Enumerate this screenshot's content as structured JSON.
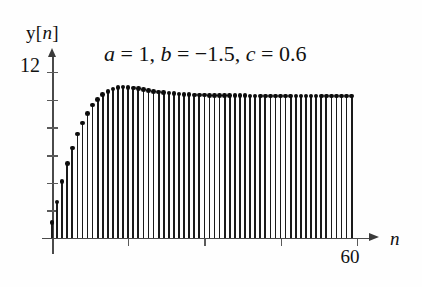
{
  "figure": {
    "title": "a = 1, b = −1.5, c = 0.6",
    "title_parts": {
      "a": "a",
      "eq1": " = 1, ",
      "b": "b",
      "eq2": " = −1.5, ",
      "c": "c",
      "eq3": " = 0.6"
    },
    "y_axis_label_base": "y[",
    "y_axis_label_var": "n",
    "y_axis_label_close": "]",
    "y_top_tick_label": "12",
    "x_tick_label": "60",
    "x_axis_label": "n",
    "line_color": "#1a1a1a",
    "axis_color": "#4a4a4a",
    "background": "#ffffff"
  },
  "chart_data": {
    "type": "line",
    "plot_style": "stem",
    "title": "a = 1, b = −1.5, c = 0.6",
    "xlabel": "n",
    "ylabel": "y[n]",
    "xlim": [
      0,
      63
    ],
    "ylim": [
      0,
      13
    ],
    "xticks": [
      0,
      15,
      30,
      45,
      60
    ],
    "xtick_labels": [
      "",
      "",
      "",
      "",
      "60"
    ],
    "yticks": [
      0,
      2,
      4,
      6,
      8,
      10,
      12
    ],
    "ytick_labels": [
      "",
      "",
      "",
      "",
      "",
      "",
      "12"
    ],
    "grid": false,
    "legend": null,
    "annotations": [
      {
        "text": "a = 1, b = −1.5, c = 0.6",
        "x": 18,
        "y": 12.4
      }
    ],
    "parameters": {
      "a": 1,
      "b": -1.5,
      "c": 0.6
    },
    "x": [
      0,
      1,
      2,
      3,
      4,
      5,
      6,
      7,
      8,
      9,
      10,
      11,
      12,
      13,
      14,
      15,
      16,
      17,
      18,
      19,
      20,
      21,
      22,
      23,
      24,
      25,
      26,
      27,
      28,
      29,
      30,
      31,
      32,
      33,
      34,
      35,
      36,
      37,
      38,
      39,
      40,
      41,
      42,
      43,
      44,
      45,
      46,
      47,
      48,
      49,
      50,
      51,
      52,
      53,
      54,
      55,
      56,
      57,
      58,
      59
    ],
    "values": [
      1.1,
      2.6,
      4.1,
      5.4,
      6.5,
      7.5,
      8.3,
      9.0,
      9.6,
      10.0,
      10.35,
      10.6,
      10.75,
      10.85,
      10.9,
      10.88,
      10.84,
      10.78,
      10.72,
      10.66,
      10.6,
      10.55,
      10.5,
      10.46,
      10.43,
      10.4,
      10.38,
      10.36,
      10.34,
      10.33,
      10.32,
      10.31,
      10.3,
      10.3,
      10.29,
      10.29,
      10.28,
      10.28,
      10.28,
      10.27,
      10.27,
      10.27,
      10.27,
      10.26,
      10.26,
      10.26,
      10.26,
      10.26,
      10.26,
      10.26,
      10.25,
      10.25,
      10.25,
      10.25,
      10.25,
      10.25,
      10.25,
      10.25,
      10.25,
      10.25
    ]
  }
}
